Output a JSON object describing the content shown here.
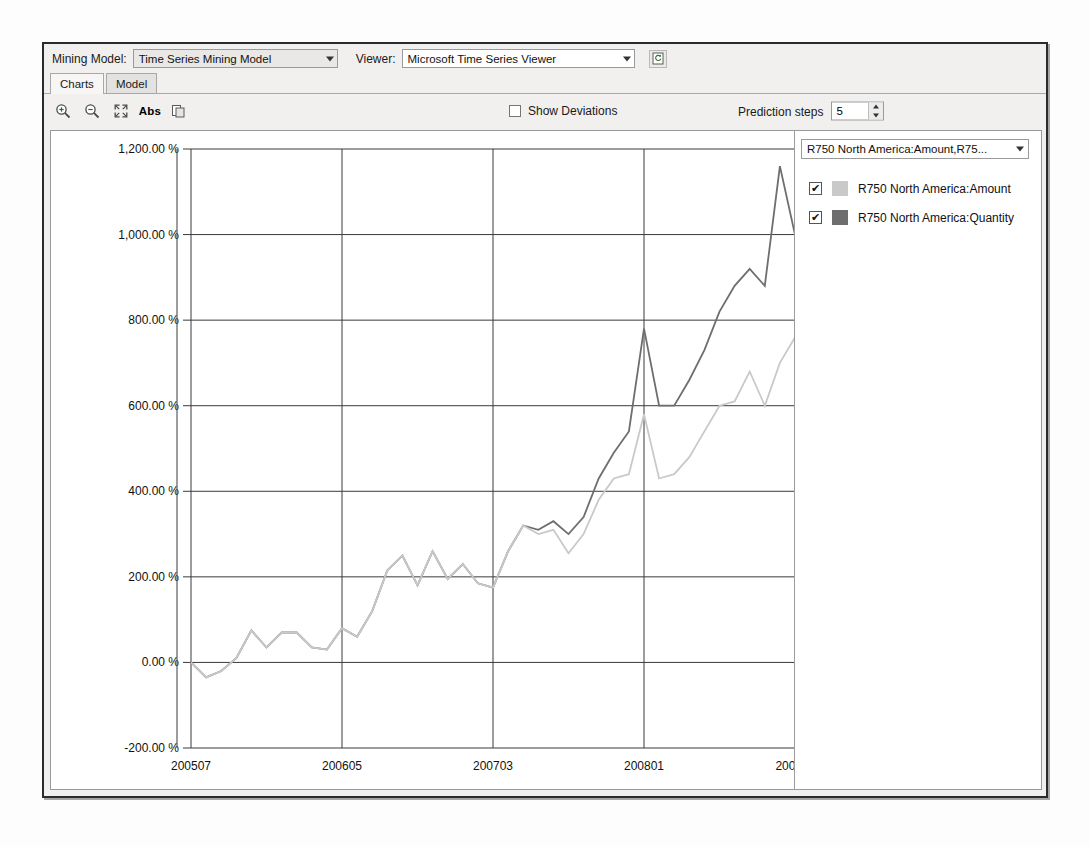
{
  "window": {
    "mining_model_label": "Mining Model:",
    "mining_model_value": "Time Series Mining Model",
    "viewer_label": "Viewer:",
    "viewer_value": "Microsoft Time Series Viewer",
    "refresh_icon": "document-refresh-icon"
  },
  "tabs": [
    {
      "label": "Charts",
      "active": true
    },
    {
      "label": "Model",
      "active": false
    }
  ],
  "toolbar": {
    "icons": [
      {
        "name": "zoom-in-icon"
      },
      {
        "name": "zoom-out-icon"
      },
      {
        "name": "fit-to-window-icon"
      },
      {
        "name": "abs-toggle-icon",
        "text": "Abs"
      },
      {
        "name": "copy-icon"
      }
    ],
    "show_deviations_label": "Show Deviations",
    "show_deviations_checked": false,
    "prediction_steps_label": "Prediction steps",
    "prediction_steps_value": "5"
  },
  "legend": {
    "selector_value": "R750 North America:Amount,R75...",
    "items": [
      {
        "label": "R750 North America:Amount",
        "color": "#c9c9c9",
        "checked": true,
        "check_glyph": "✔"
      },
      {
        "label": "R750 North America:Quantity",
        "color": "#6e6e6e",
        "checked": true,
        "check_glyph": "✔"
      }
    ]
  },
  "chart_data": {
    "type": "line",
    "title": "",
    "xlabel": "",
    "ylabel": "",
    "ylim": [
      -200,
      1200
    ],
    "ytick_labels": [
      "1,200.00 %",
      "1,000.00 %",
      "800.00 %",
      "600.00 %",
      "400.00 %",
      "200.00 %",
      "0.00 %",
      "-200.00 %"
    ],
    "ytick_values": [
      1200,
      1000,
      800,
      600,
      400,
      200,
      0,
      -200
    ],
    "xtick_labels": [
      "200507",
      "200605",
      "200703",
      "200801",
      "200811"
    ],
    "xtick_values": [
      200507,
      200605,
      200703,
      200801,
      200811
    ],
    "grid": true,
    "legend_position": "right-panel",
    "forecast_start_index": 41,
    "forecast_style": "dotted",
    "forecast_shading": "#e8e8e8",
    "x": [
      200507,
      200508,
      200509,
      200510,
      200511,
      200512,
      200601,
      200602,
      200603,
      200604,
      200605,
      200606,
      200607,
      200608,
      200609,
      200610,
      200611,
      200612,
      200701,
      200702,
      200703,
      200704,
      200705,
      200706,
      200707,
      200708,
      200709,
      200710,
      200711,
      200712,
      200801,
      200802,
      200803,
      200804,
      200805,
      200806,
      200807,
      200808,
      200809,
      200810,
      200811
    ],
    "series": [
      {
        "name": "R750 North America:Quantity",
        "color": "#6e6e6e",
        "values": [
          0,
          -35,
          -20,
          10,
          75,
          35,
          70,
          70,
          35,
          30,
          80,
          60,
          120,
          215,
          250,
          180,
          260,
          195,
          230,
          185,
          175,
          260,
          320,
          310,
          330,
          300,
          340,
          430,
          490,
          540,
          780,
          600,
          600,
          660,
          730,
          820,
          880,
          920,
          880,
          1160,
          1000
        ]
      },
      {
        "name": "R750 North America:Amount",
        "color": "#c9c9c9",
        "values": [
          0,
          -35,
          -20,
          10,
          75,
          35,
          70,
          70,
          35,
          30,
          80,
          60,
          120,
          215,
          250,
          180,
          260,
          195,
          230,
          185,
          175,
          260,
          320,
          300,
          310,
          255,
          300,
          380,
          430,
          440,
          580,
          430,
          440,
          480,
          540,
          600,
          610,
          680,
          600,
          700,
          760
        ]
      }
    ]
  }
}
